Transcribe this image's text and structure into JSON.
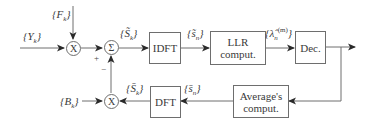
{
  "diagram": {
    "inputs": {
      "y_label": "{Y",
      "y_sub": "k",
      "f_label": "{F",
      "f_sub": "k",
      "b_label": "{B",
      "b_sub": "k"
    },
    "nodes": {
      "top_multiplier": "X",
      "summer": "Σ",
      "bottom_multiplier": "X"
    },
    "signs": {
      "plus": "+",
      "minus": "−"
    },
    "blocks": {
      "idft": "IDFT",
      "llr_line1": "LLR",
      "llr_line2": "comput.",
      "dec": "Dec.",
      "average_line1": "Average's",
      "average_line2": "comput.",
      "dft": "DFT"
    },
    "signals": {
      "s_tilde_k": "{S̃",
      "s_tilde_k_sub": "k",
      "s_tilde_n": "{s̃",
      "s_tilde_n_sub": "n",
      "lambda": "{λ̂",
      "lambda_sub": "n",
      "lambda_sup": "(m)",
      "s_bar_k": "{S̄",
      "s_bar_k_sub": "k",
      "s_bar_n": "{s̄",
      "s_bar_n_sub": "n",
      "close": "}"
    },
    "colors": {
      "line": "#6e6e6e",
      "arrow": "#2a2a2a"
    }
  }
}
